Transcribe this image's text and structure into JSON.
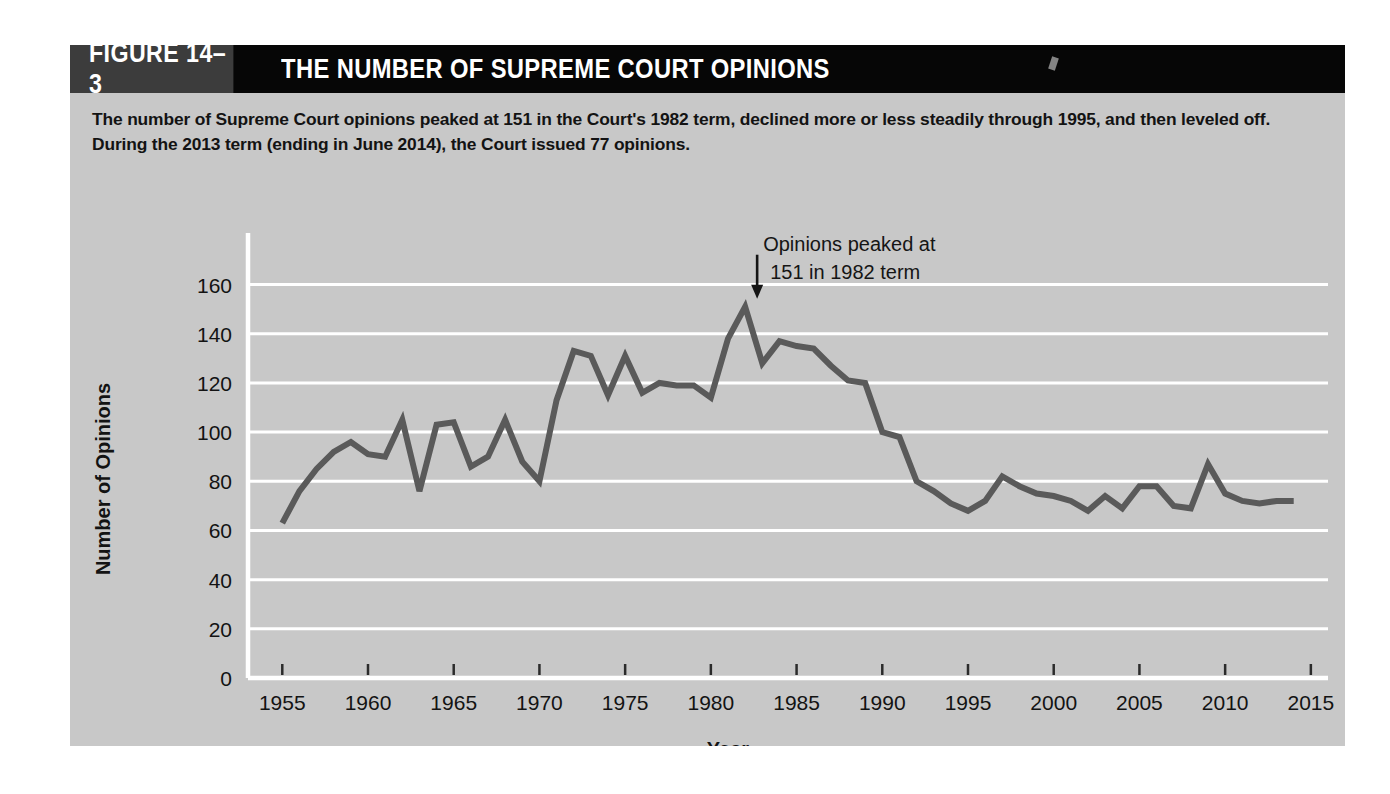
{
  "figure": {
    "tag": "FIGURE 14–3",
    "title": "THE NUMBER OF SUPREME COURT OPINIONS",
    "caption": "The number of Supreme Court opinions peaked at 151 in the Court's 1982 term, declined more or less steadily through 1995, and then leveled off. During the 2013 term (ending in June 2014), the Court issued 77 opinions."
  },
  "colors": {
    "header_bar": "#060606",
    "figure_tag_box": "#3c3c3c",
    "panel_background": "#c8c8c8",
    "gridline": "#ffffff",
    "line": "#5a5a5a",
    "text": "#131313"
  },
  "chart_data": {
    "type": "line",
    "title": "THE NUMBER OF SUPREME COURT OPINIONS",
    "xlabel": "Year",
    "ylabel": "Number of Opinions",
    "xlim": [
      1953,
      2016
    ],
    "ylim": [
      0,
      170
    ],
    "grid": true,
    "legend": "none",
    "xticks": [
      1955,
      1960,
      1965,
      1970,
      1975,
      1980,
      1985,
      1990,
      1995,
      2000,
      2005,
      2010,
      2015
    ],
    "yticks": [
      0,
      20,
      40,
      60,
      80,
      100,
      120,
      140,
      160
    ],
    "annotations": [
      {
        "text_line1": "Opinions peaked at",
        "text_line2": "151 in 1982 term",
        "marker": "down-arrow",
        "points_to_year": 1982,
        "points_to_value": 151
      }
    ],
    "series": [
      {
        "name": "Number of Opinions",
        "color": "#5a5a5a",
        "x": [
          1955,
          1956,
          1957,
          1958,
          1959,
          1960,
          1961,
          1962,
          1963,
          1964,
          1965,
          1966,
          1967,
          1968,
          1969,
          1970,
          1971,
          1972,
          1973,
          1974,
          1975,
          1976,
          1977,
          1978,
          1979,
          1980,
          1981,
          1982,
          1983,
          1984,
          1985,
          1986,
          1987,
          1988,
          1989,
          1990,
          1991,
          1992,
          1993,
          1994,
          1995,
          1996,
          1997,
          1998,
          1999,
          2000,
          2001,
          2002,
          2003,
          2004,
          2005,
          2006,
          2007,
          2008,
          2009,
          2010,
          2011,
          2012,
          2013,
          2014
        ],
        "values": [
          63,
          76,
          85,
          92,
          96,
          91,
          90,
          105,
          76,
          103,
          104,
          86,
          90,
          105,
          88,
          80,
          113,
          133,
          131,
          115,
          131,
          116,
          120,
          119,
          119,
          114,
          138,
          151,
          128,
          137,
          135,
          134,
          127,
          121,
          120,
          100,
          98,
          80,
          76,
          71,
          68,
          72,
          82,
          78,
          75,
          74,
          72,
          68,
          74,
          69,
          78,
          78,
          70,
          69,
          87,
          75,
          72,
          71,
          72,
          72
        ]
      }
    ]
  }
}
